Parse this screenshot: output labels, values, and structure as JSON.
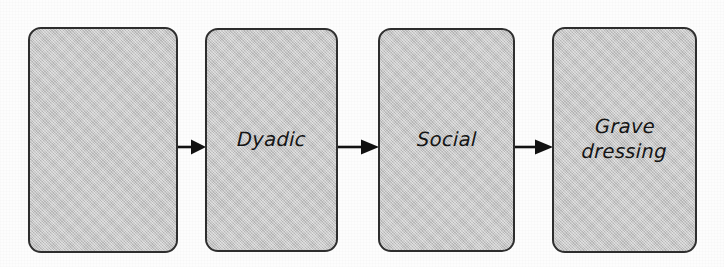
{
  "diagram": {
    "type": "flow-diagram",
    "orientation": "horizontal-left-to-right",
    "title": "",
    "background_color": "#fdfdfd",
    "box_fill_color": "#c6c6c6",
    "box_border_color": "#2e2e2e",
    "arrow_color": "#111111",
    "text_color": "#151515",
    "nodes": [
      {
        "id": "phase-1",
        "label": "",
        "x": 28,
        "y": 27,
        "width": 150,
        "height": 226
      },
      {
        "id": "phase-2",
        "label": "Dyadic",
        "x": 205,
        "y": 28,
        "width": 133,
        "height": 224
      },
      {
        "id": "phase-3",
        "label": "Social",
        "x": 378,
        "y": 28,
        "width": 137,
        "height": 224
      },
      {
        "id": "phase-4",
        "label": "Grave\ndressing",
        "x": 552,
        "y": 27,
        "width": 145,
        "height": 226
      }
    ],
    "connectors": [
      {
        "id": "arrow-1",
        "from": "phase-1",
        "to": "phase-2",
        "x": 178,
        "y": 138,
        "width": 28,
        "height": 18
      },
      {
        "id": "arrow-2",
        "from": "phase-2",
        "to": "phase-3",
        "x": 338,
        "y": 138,
        "width": 41,
        "height": 18
      },
      {
        "id": "arrow-3",
        "from": "phase-3",
        "to": "phase-4",
        "x": 515,
        "y": 138,
        "width": 38,
        "height": 18
      }
    ]
  }
}
